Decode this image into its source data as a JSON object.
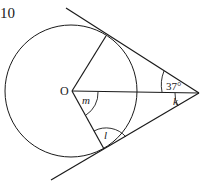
{
  "problem_number": "10",
  "diagram": {
    "type": "circle-tangents",
    "center_label": "O",
    "angles": {
      "given": "37°",
      "k": "k",
      "m": "m",
      "l": "l"
    },
    "colors": {
      "stroke": "#1a1a1a",
      "background": "#ffffff"
    }
  }
}
